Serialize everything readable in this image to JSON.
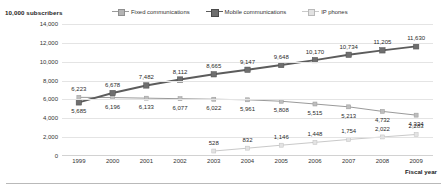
{
  "chart_data": {
    "type": "line",
    "title": "",
    "ylabel": "10,000 subscribers",
    "xlabel": "Fiscal year",
    "categories": [
      "1999",
      "2000",
      "2001",
      "2002",
      "2003",
      "2004",
      "2005",
      "2006",
      "2007",
      "2008",
      "2009"
    ],
    "ylim": [
      0,
      14000
    ],
    "yticks": [
      "0",
      "2,000",
      "4,000",
      "6,000",
      "8,000",
      "10,000",
      "12,000",
      "14,000"
    ],
    "ytick_values": [
      0,
      2000,
      4000,
      6000,
      8000,
      10000,
      12000,
      14000
    ],
    "grid": true,
    "legend_position": "top-center",
    "series": [
      {
        "name": "Fixed communications",
        "values": [
          6223,
          6196,
          6133,
          6077,
          6022,
          5961,
          5808,
          5515,
          5213,
          4732,
          4334
        ],
        "labels": [
          "6,223",
          "6,196",
          "6,133",
          "6,077",
          "6,022",
          "5,961",
          "5,808",
          "5,515",
          "5,213",
          "4,732",
          "4,334"
        ],
        "color": "#9a9a9a"
      },
      {
        "name": "Mobile communications",
        "values": [
          5685,
          6678,
          7482,
          8112,
          8665,
          9147,
          9648,
          10170,
          10734,
          11205,
          11630
        ],
        "labels": [
          "5,685",
          "6,678",
          "7,482",
          "8,112",
          "8,665",
          "9,147",
          "9,648",
          "10,170",
          "10,734",
          "11,205",
          "11,630"
        ],
        "color": "#5c5c5c"
      },
      {
        "name": "IP phones",
        "values": [
          null,
          null,
          null,
          null,
          528,
          832,
          1146,
          1448,
          1754,
          2022,
          2283
        ],
        "labels": [
          "",
          "",
          "",
          "",
          "528",
          "832",
          "1,146",
          "1,448",
          "1,754",
          "2,022",
          "2,283"
        ],
        "color": "#c9c9c9"
      }
    ]
  },
  "legend": {
    "items": [
      {
        "label": "Fixed communications"
      },
      {
        "label": "Mobile communications"
      },
      {
        "label": "IP phones"
      }
    ]
  }
}
